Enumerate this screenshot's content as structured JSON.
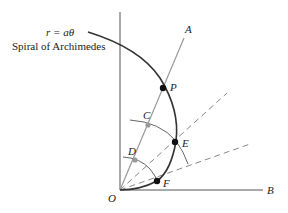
{
  "diagram": {
    "equation": "r = aθ",
    "title": "Spiral of Archimedes",
    "colors": {
      "spiral": "#333333",
      "axes": "#555555",
      "ray": "#888888",
      "dashed": "#888888",
      "arcs": "#666666",
      "point_dark": "#111111",
      "point_light": "#999999"
    },
    "labels": {
      "A": "A",
      "B": "B",
      "O": "O",
      "P": "P",
      "C": "C",
      "D": "D",
      "E": "E",
      "F": "F"
    }
  }
}
